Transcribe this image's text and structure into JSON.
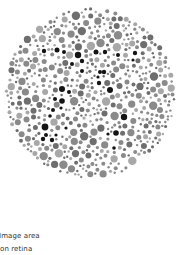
{
  "figure": {
    "type": "pseudoisochromatic-plate",
    "circle": {
      "cx": 90,
      "cy": 93,
      "r": 86
    },
    "colors": {
      "background": "#ffffff",
      "dot_light": "#a8a8a8",
      "dot_mid": "#8a8a8a",
      "dot_dark_gray": "#6e6e6e",
      "figure_dot": "#141414"
    },
    "figure_dots": [
      [
        44,
        51,
        2.2
      ],
      [
        57,
        50,
        2.5
      ],
      [
        64,
        52,
        2
      ],
      [
        78,
        55,
        3.2
      ],
      [
        72,
        64,
        2
      ],
      [
        82,
        61,
        2.2
      ],
      [
        82,
        71,
        2
      ],
      [
        96,
        52,
        2.5
      ],
      [
        105,
        52,
        2.2
      ],
      [
        118,
        55,
        2
      ],
      [
        135,
        53,
        2.2
      ],
      [
        133,
        60,
        1.6
      ],
      [
        100,
        72,
        2
      ],
      [
        104,
        72,
        2.2
      ],
      [
        98,
        77,
        1.6
      ],
      [
        110,
        90,
        3
      ],
      [
        99,
        83,
        2.2
      ],
      [
        62,
        89,
        3
      ],
      [
        69,
        92,
        2
      ],
      [
        62,
        101,
        2.8
      ],
      [
        55,
        99,
        2
      ],
      [
        61,
        108,
        1.6
      ],
      [
        53,
        110,
        2
      ],
      [
        50,
        116,
        1.8
      ],
      [
        45,
        127,
        3.4
      ],
      [
        46,
        135,
        2
      ],
      [
        43,
        139,
        2.2
      ],
      [
        52,
        140,
        2.2
      ],
      [
        56,
        135,
        1.6
      ],
      [
        124,
        117,
        3.2
      ],
      [
        116,
        133,
        2.8
      ],
      [
        108,
        134,
        1.6
      ],
      [
        114,
        148,
        1.8
      ],
      [
        66,
        128,
        1.6
      ]
    ]
  },
  "caption": {
    "line1": "Image area",
    "line2": "on retina"
  }
}
